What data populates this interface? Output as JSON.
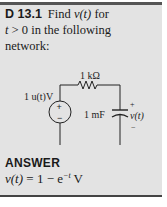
{
  "problem": {
    "label": "D 13.1",
    "text_1": "Find ",
    "var": "v(t)",
    "text_2": " for",
    "line2_var": "t",
    "line2_text": " > 0 in the following",
    "line3_text": "network:"
  },
  "circuit": {
    "resistor_label": "1 kΩ",
    "source_label": "1 u(t)V",
    "source_plus": "+",
    "source_minus": "−",
    "capacitor_label": "1 mF",
    "output_plus": "+",
    "output_label": "v(t)",
    "output_minus": "−"
  },
  "answer": {
    "heading": "ANSWER",
    "lhs": "v(t)",
    "eq": " = 1 − e",
    "exp": "−t",
    "unit": " V"
  }
}
